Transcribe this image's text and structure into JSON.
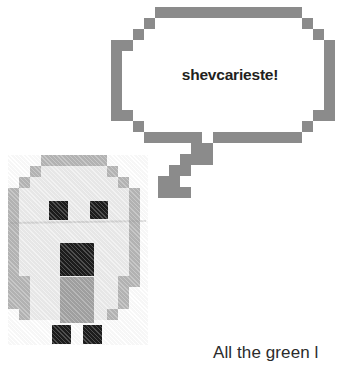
{
  "page": {
    "background_color": "#ffffff",
    "width": 340,
    "height": 365
  },
  "speech_bubble": {
    "name": "speech-bubble",
    "text": "shevcarieste!",
    "text_color": "#231f20",
    "border_color": "#8b8b8b",
    "fill_color": "#ffffff",
    "style": "pixelated"
  },
  "creature": {
    "name": "pixel-creature",
    "description": "pixel-art ghost creature with two eyes, open mouth and two feet",
    "outline_color": "#b3b3b3",
    "body_color": "#ededed",
    "shadow_color": "#9e9e9e",
    "feature_color": "#0d0d0d",
    "parts": {
      "left_eye": "left-eye",
      "right_eye": "right-eye",
      "mouth": "mouth",
      "left_foot": "left-foot",
      "right_foot": "right-foot"
    }
  },
  "caption": {
    "name": "bottom-caption",
    "text": "All the green l"
  }
}
